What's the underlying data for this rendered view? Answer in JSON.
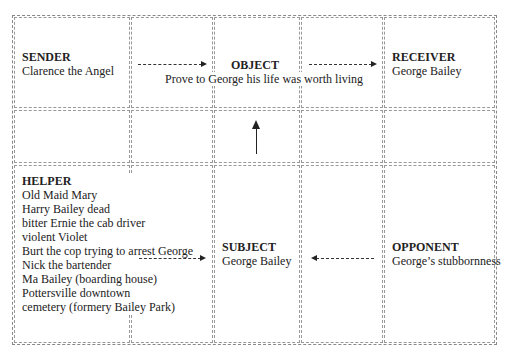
{
  "diagram": {
    "type": "actantial-model",
    "sender": {
      "title": "SENDER",
      "lines": [
        "Clarence the Angel"
      ]
    },
    "object": {
      "title": "OBJECT",
      "lines": [
        "Prove to George his life was worth living"
      ]
    },
    "receiver": {
      "title": "RECEIVER",
      "lines": [
        "George Bailey"
      ]
    },
    "helper": {
      "title": "HELPER",
      "lines": [
        "Old Maid Mary",
        "Harry Bailey dead",
        "bitter Ernie the cab driver",
        "violent Violet",
        "Burt the cop trying to arrest George",
        "Nick the bartender",
        "Ma Bailey (boarding house)",
        "Pottersville downtown",
        "cemetery (formery Bailey Park)"
      ]
    },
    "subject": {
      "title": "SUBJECT",
      "lines": [
        "George Bailey"
      ]
    },
    "opponent": {
      "title": "OPPONENT",
      "lines": [
        "George’s stubbornness"
      ]
    },
    "arrows": [
      {
        "from": "sender",
        "to": "object",
        "style": "dashed"
      },
      {
        "from": "object",
        "to": "receiver",
        "style": "dashed"
      },
      {
        "from": "subject",
        "to": "object",
        "style": "solid"
      },
      {
        "from": "helper",
        "to": "subject",
        "style": "dashed"
      },
      {
        "from": "opponent",
        "to": "subject",
        "style": "dashed"
      }
    ]
  }
}
